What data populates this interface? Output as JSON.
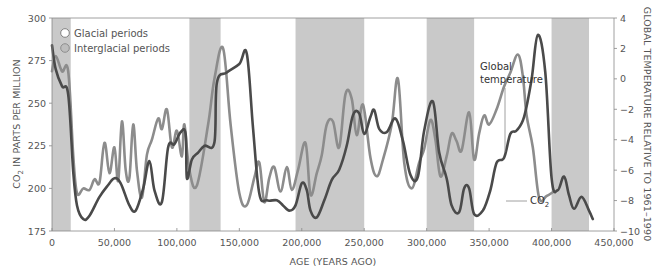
{
  "chart_data": {
    "type": "line",
    "title": "",
    "xlabel": "AGE (YEARS AGO)",
    "ylabel_left": "CO2 IN PARTS PER MILLION",
    "ylabel_right": "GLOBAL TEMPERATURE RELATIVE TO 1961–1990",
    "xlim": [
      0,
      450000
    ],
    "ylim_left": [
      175,
      300
    ],
    "ylim_right": [
      -10,
      4
    ],
    "x_ticks": [
      0,
      50000,
      100000,
      150000,
      200000,
      250000,
      300000,
      350000,
      400000,
      450000
    ],
    "x_tick_labels": [
      "0",
      "50,000",
      "100,000",
      "150,000",
      "200,000",
      "250,000",
      "300,000",
      "350,000",
      "400,000",
      "450,000"
    ],
    "y_left_ticks": [
      175,
      200,
      225,
      250,
      275,
      300
    ],
    "y_right_ticks": [
      -10,
      -8,
      -6,
      -4,
      -2,
      0,
      2,
      4
    ],
    "y_right_tick_labels": [
      "−10",
      "−8",
      "−6",
      "−4",
      "−2",
      "0",
      "2",
      "4"
    ],
    "grid": false,
    "legend": {
      "position": "top-left",
      "entries": [
        {
          "label": "Glacial periods",
          "swatch": "hollow-circle",
          "color": "#ffffff"
        },
        {
          "label": "Interglacial periods",
          "swatch": "filled-circle",
          "color": "#c8c8c8"
        }
      ]
    },
    "interglacial_bands": [
      {
        "start": 0,
        "end": 15000
      },
      {
        "start": 110000,
        "end": 135000
      },
      {
        "start": 195000,
        "end": 250000
      },
      {
        "start": 300000,
        "end": 338000
      },
      {
        "start": 400000,
        "end": 430000
      }
    ],
    "series": [
      {
        "name": "CO2",
        "axis": "left",
        "color": "#4a4a4a",
        "points": [
          [
            0,
            284
          ],
          [
            3000,
            270
          ],
          [
            8000,
            260
          ],
          [
            13000,
            255
          ],
          [
            17000,
            210
          ],
          [
            20000,
            190
          ],
          [
            25000,
            182
          ],
          [
            30000,
            184
          ],
          [
            38000,
            195
          ],
          [
            45000,
            202
          ],
          [
            50000,
            206
          ],
          [
            55000,
            203
          ],
          [
            62000,
            190
          ],
          [
            67000,
            187
          ],
          [
            73000,
            200
          ],
          [
            78000,
            216
          ],
          [
            82000,
            199
          ],
          [
            88000,
            192
          ],
          [
            93000,
            224
          ],
          [
            98000,
            226
          ],
          [
            103000,
            233
          ],
          [
            107000,
            232
          ],
          [
            108000,
            206
          ],
          [
            112000,
            217
          ],
          [
            117000,
            221
          ],
          [
            122000,
            225
          ],
          [
            130000,
            227
          ],
          [
            132000,
            262
          ],
          [
            140000,
            268
          ],
          [
            150000,
            273
          ],
          [
            156000,
            279
          ],
          [
            161000,
            235
          ],
          [
            166000,
            197
          ],
          [
            172000,
            193
          ],
          [
            180000,
            193
          ],
          [
            185000,
            190
          ],
          [
            190000,
            187
          ],
          [
            195000,
            190
          ],
          [
            200000,
            203
          ],
          [
            204000,
            199
          ],
          [
            207000,
            187
          ],
          [
            212000,
            183
          ],
          [
            218000,
            193
          ],
          [
            224000,
            205
          ],
          [
            230000,
            211
          ],
          [
            236000,
            225
          ],
          [
            241000,
            243
          ],
          [
            246000,
            244
          ],
          [
            250000,
            232
          ],
          [
            255000,
            242
          ],
          [
            258000,
            246
          ],
          [
            262000,
            235
          ],
          [
            268000,
            233
          ],
          [
            275000,
            241
          ],
          [
            281000,
            228
          ],
          [
            287000,
            208
          ],
          [
            293000,
            207
          ],
          [
            298000,
            234
          ],
          [
            305000,
            251
          ],
          [
            310000,
            221
          ],
          [
            316000,
            206
          ],
          [
            320000,
            190
          ],
          [
            326000,
            186
          ],
          [
            330000,
            200
          ],
          [
            334000,
            200
          ],
          [
            338000,
            185
          ],
          [
            345000,
            187
          ],
          [
            351000,
            199
          ],
          [
            356000,
            215
          ],
          [
            362000,
            218
          ],
          [
            367000,
            232
          ],
          [
            372000,
            234
          ],
          [
            378000,
            242
          ],
          [
            384000,
            264
          ],
          [
            389000,
            290
          ],
          [
            395000,
            268
          ],
          [
            400000,
            206
          ],
          [
            405000,
            199
          ],
          [
            410000,
            207
          ],
          [
            414000,
            196
          ],
          [
            418000,
            188
          ],
          [
            424000,
            195
          ],
          [
            430000,
            187
          ],
          [
            433000,
            182
          ]
        ]
      },
      {
        "name": "Global temperature",
        "axis": "right",
        "color": "#8c8c8c",
        "points": [
          [
            0,
            0.5
          ],
          [
            3000,
            1.5
          ],
          [
            8000,
            0.5
          ],
          [
            13000,
            0.5
          ],
          [
            17000,
            -5
          ],
          [
            20000,
            -7.5
          ],
          [
            25000,
            -7.2
          ],
          [
            30000,
            -7.3
          ],
          [
            34000,
            -6.6
          ],
          [
            38000,
            -6.8
          ],
          [
            42000,
            -4.2
          ],
          [
            46000,
            -6.2
          ],
          [
            50000,
            -4.5
          ],
          [
            53000,
            -6.7
          ],
          [
            56000,
            -2.8
          ],
          [
            59000,
            -6
          ],
          [
            62000,
            -6.5
          ],
          [
            65000,
            -3
          ],
          [
            68000,
            -6
          ],
          [
            72000,
            -7.8
          ],
          [
            76000,
            -5
          ],
          [
            80000,
            -4
          ],
          [
            85000,
            -2.6
          ],
          [
            88000,
            -3.3
          ],
          [
            92000,
            -2
          ],
          [
            96000,
            -4.5
          ],
          [
            100000,
            -3.4
          ],
          [
            104000,
            -5.1
          ],
          [
            106000,
            -3
          ],
          [
            110000,
            -6
          ],
          [
            116000,
            -7
          ],
          [
            125000,
            -3
          ],
          [
            130000,
            0
          ],
          [
            137000,
            2
          ],
          [
            143000,
            -3
          ],
          [
            150000,
            -7.5
          ],
          [
            156000,
            -8.3
          ],
          [
            162000,
            -6.5
          ],
          [
            166000,
            -5.5
          ],
          [
            170000,
            -8.1
          ],
          [
            174000,
            -6.5
          ],
          [
            178000,
            -5.8
          ],
          [
            183000,
            -7.4
          ],
          [
            188000,
            -5.8
          ],
          [
            192000,
            -7.3
          ],
          [
            197000,
            -6
          ],
          [
            203000,
            -4.2
          ],
          [
            207000,
            -7.6
          ],
          [
            212000,
            -6.2
          ],
          [
            216000,
            -5
          ],
          [
            220000,
            -3
          ],
          [
            225000,
            -2.8
          ],
          [
            230000,
            -4.5
          ],
          [
            235000,
            -1
          ],
          [
            240000,
            -1.3
          ],
          [
            244000,
            -3.7
          ],
          [
            249000,
            -1.7
          ],
          [
            255000,
            -5.2
          ],
          [
            260000,
            -6.4
          ],
          [
            265000,
            -5.3
          ],
          [
            272000,
            -3
          ],
          [
            277000,
            0
          ],
          [
            282000,
            -5.5
          ],
          [
            288000,
            -7.2
          ],
          [
            294000,
            -5.5
          ],
          [
            298000,
            -4.6
          ],
          [
            303000,
            -2.7
          ],
          [
            307000,
            -4
          ],
          [
            311000,
            -6.4
          ],
          [
            316000,
            -5.1
          ],
          [
            320000,
            -3.6
          ],
          [
            324000,
            -4.1
          ],
          [
            328000,
            -4.7
          ],
          [
            334000,
            -2.2
          ],
          [
            338000,
            -5.3
          ],
          [
            342000,
            -3.6
          ],
          [
            346000,
            -2.4
          ],
          [
            350000,
            -3
          ],
          [
            356000,
            -2
          ],
          [
            362000,
            -0.5
          ],
          [
            367000,
            0.4
          ],
          [
            373000,
            1.6
          ],
          [
            377000,
            0.2
          ],
          [
            380000,
            -2.4
          ],
          [
            385000,
            -4.5
          ],
          [
            390000,
            -7.8
          ],
          [
            396000,
            -7.7
          ],
          [
            402000,
            -7.4
          ]
        ]
      }
    ],
    "annotations": [
      {
        "text": "Global temperature",
        "line1": "Global",
        "line2": "temperature"
      },
      {
        "text": "CO2",
        "main": "CO",
        "sub": "2"
      }
    ]
  },
  "axis": {
    "left_title_prefix": "CO",
    "left_title_sub": "2",
    "left_title_rest": " IN PARTS PER MILLION",
    "right_title": "GLOBAL TEMPERATURE RELATIVE TO 1961–1990",
    "bottom_title": "AGE (YEARS AGO)"
  },
  "legend": {
    "glacial": "Glacial periods",
    "interglacial": "Interglacial periods"
  },
  "callouts": {
    "temp_line1": "Global",
    "temp_line2": "temperature",
    "co2_main": "CO",
    "co2_sub": "2"
  },
  "colors": {
    "band": "#c9c9c9",
    "co2_line": "#4a4a4a",
    "temp_line": "#8e8e8e",
    "axis": "#888888",
    "text": "#555555"
  }
}
